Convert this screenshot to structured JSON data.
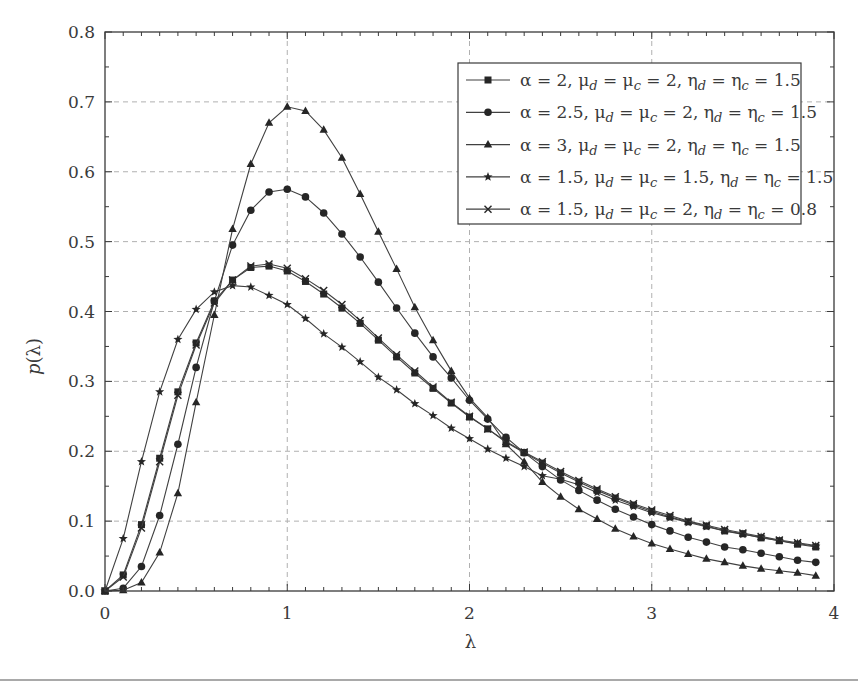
{
  "chart_data": {
    "type": "line",
    "title": "",
    "xlabel": "λ",
    "ylabel": "p(λ)",
    "xlim": [
      0,
      4
    ],
    "ylim": [
      0,
      0.8
    ],
    "x_ticks": [
      0,
      1,
      2,
      3,
      4
    ],
    "x_tick_labels": [
      "0",
      "1",
      "2",
      "3",
      "4"
    ],
    "y_ticks": [
      0.0,
      0.1,
      0.2,
      0.3,
      0.4,
      0.5,
      0.6,
      0.7,
      0.8
    ],
    "y_tick_labels": [
      "0.0",
      "0.1",
      "0.2",
      "0.3",
      "0.4",
      "0.5",
      "0.6",
      "0.7",
      "0.8"
    ],
    "grid": true,
    "legend_position": "upper right",
    "x": [
      0,
      0.1,
      0.2,
      0.3,
      0.4,
      0.5,
      0.6,
      0.7,
      0.8,
      0.9,
      1.0,
      1.1,
      1.2,
      1.3,
      1.4,
      1.5,
      1.6,
      1.7,
      1.8,
      1.9,
      2.0,
      2.1,
      2.2,
      2.3,
      2.4,
      2.5,
      2.6,
      2.7,
      2.8,
      2.9,
      3.0,
      3.1,
      3.2,
      3.3,
      3.4,
      3.5,
      3.6,
      3.7,
      3.8,
      3.9
    ],
    "series": [
      {
        "name": "α = 2, μd = μc = 2, ηd = ηc = 1.5",
        "label_parts": {
          "alpha": "2",
          "mu": "2",
          "eta": "1.5"
        },
        "marker": "square",
        "values": [
          0,
          0.023,
          0.095,
          0.19,
          0.285,
          0.355,
          0.415,
          0.445,
          0.463,
          0.465,
          0.458,
          0.443,
          0.425,
          0.405,
          0.383,
          0.359,
          0.335,
          0.312,
          0.29,
          0.269,
          0.249,
          0.232,
          0.213,
          0.198,
          0.183,
          0.169,
          0.156,
          0.144,
          0.133,
          0.123,
          0.114,
          0.106,
          0.099,
          0.093,
          0.086,
          0.082,
          0.076,
          0.072,
          0.067,
          0.063
        ]
      },
      {
        "name": "α = 2.5, μd = μc = 2, ηd = ηc = 1.5",
        "label_parts": {
          "alpha": "2.5",
          "mu": "2",
          "eta": "1.5"
        },
        "marker": "circle",
        "values": [
          0,
          0.004,
          0.035,
          0.108,
          0.21,
          0.32,
          0.415,
          0.495,
          0.545,
          0.571,
          0.575,
          0.564,
          0.541,
          0.511,
          0.478,
          0.442,
          0.405,
          0.369,
          0.335,
          0.305,
          0.273,
          0.246,
          0.22,
          0.198,
          0.178,
          0.159,
          0.144,
          0.13,
          0.117,
          0.106,
          0.095,
          0.086,
          0.077,
          0.07,
          0.063,
          0.059,
          0.054,
          0.049,
          0.044,
          0.041
        ]
      },
      {
        "name": "α = 3, μd = μc = 2, ηd = ηc = 1.5",
        "label_parts": {
          "alpha": "3",
          "mu": "2",
          "eta": "1.5"
        },
        "marker": "triangle",
        "values": [
          0,
          0.001,
          0.012,
          0.055,
          0.14,
          0.27,
          0.395,
          0.518,
          0.611,
          0.67,
          0.693,
          0.687,
          0.66,
          0.62,
          0.568,
          0.514,
          0.461,
          0.406,
          0.359,
          0.315,
          0.276,
          0.248,
          0.21,
          0.185,
          0.156,
          0.135,
          0.117,
          0.103,
          0.089,
          0.078,
          0.068,
          0.06,
          0.053,
          0.046,
          0.041,
          0.036,
          0.032,
          0.029,
          0.026,
          0.022
        ]
      },
      {
        "name": "α = 1.5, μd = μc = 1.5, ηd = ηc = 1.5",
        "label_parts": {
          "alpha": "1.5",
          "mu": "1.5",
          "eta": "1.5"
        },
        "marker": "star",
        "values": [
          0,
          0.075,
          0.185,
          0.285,
          0.36,
          0.403,
          0.428,
          0.437,
          0.435,
          0.423,
          0.41,
          0.39,
          0.368,
          0.349,
          0.328,
          0.306,
          0.288,
          0.268,
          0.251,
          0.233,
          0.218,
          0.203,
          0.19,
          0.178,
          0.165,
          0.16,
          0.152,
          0.141,
          0.13,
          0.121,
          0.112,
          0.105,
          0.098,
          0.092,
          0.086,
          0.081,
          0.077,
          0.072,
          0.068,
          0.064
        ]
      },
      {
        "name": "α = 1.5, μd = μc = 2, ηd = ηc = 0.8",
        "label_parts": {
          "alpha": "1.5",
          "mu": "2",
          "eta": "0.8"
        },
        "marker": "cross",
        "values": [
          0,
          0.02,
          0.09,
          0.185,
          0.28,
          0.352,
          0.412,
          0.445,
          0.465,
          0.468,
          0.462,
          0.447,
          0.43,
          0.41,
          0.387,
          0.362,
          0.338,
          0.315,
          0.292,
          0.27,
          0.25,
          0.232,
          0.214,
          0.199,
          0.185,
          0.171,
          0.158,
          0.146,
          0.135,
          0.125,
          0.116,
          0.108,
          0.1,
          0.094,
          0.088,
          0.083,
          0.078,
          0.073,
          0.069,
          0.065
        ]
      }
    ]
  },
  "colors": {
    "axis": "#3a3a3a",
    "grid": "#b0b0b0",
    "line": "#404040",
    "marker": "#262626",
    "background": "#ffffff"
  }
}
